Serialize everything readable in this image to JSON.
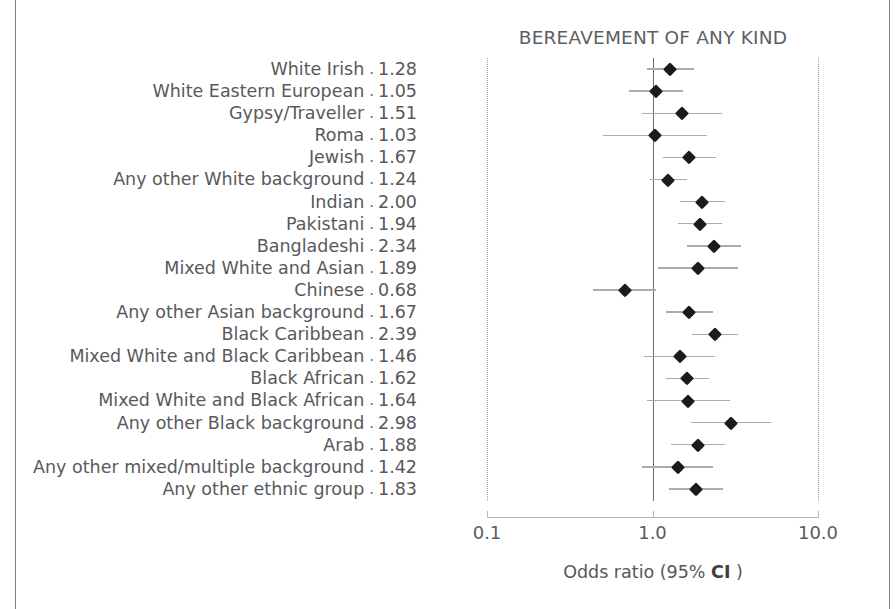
{
  "chart_data": {
    "type": "scatter",
    "subtype": "forest-plot",
    "title": "BEREAVEMENT OF ANY KIND",
    "xlabel_prefix": "Odds ratio (95% ",
    "xlabel_emph": "CI",
    "xlabel_suffix": " )",
    "xlabel_full": "Odds ratio (95% CI )",
    "ylabel": "",
    "xscale": "log",
    "xlim": [
      0.1,
      10.0
    ],
    "xticks": [
      0.1,
      1.0,
      10.0
    ],
    "xticklabels": [
      "0.1",
      "1.0",
      "10.0"
    ],
    "reference_line": 1.0,
    "grid": "dotted vertical at 0.1 and 10.0",
    "legend": "none",
    "marker": "black diamond",
    "value_separator": ".",
    "categories": [
      "White Irish",
      "White Eastern European",
      "Gypsy/Traveller",
      "Roma",
      "Jewish",
      "Any other White background",
      "Indian",
      "Pakistani",
      "Bangladeshi",
      "Mixed White and Asian",
      "Chinese",
      "Any other Asian background",
      "Black Caribbean",
      "Mixed White and Black Caribbean",
      "Black African",
      "Mixed White and Black African",
      "Any other Black background",
      "Arab",
      "Any other mixed/multiple background",
      "Any other ethnic group"
    ],
    "values": [
      1.28,
      1.05,
      1.51,
      1.03,
      1.67,
      1.24,
      2.0,
      1.94,
      2.34,
      1.89,
      0.68,
      1.67,
      2.39,
      1.46,
      1.62,
      1.64,
      2.98,
      1.88,
      1.42,
      1.83
    ],
    "value_labels": [
      "1.28",
      "1.05",
      "1.51",
      "1.03",
      "1.67",
      "1.24",
      "2.00",
      "1.94",
      "2.34",
      "1.89",
      "0.68",
      "1.67",
      "2.39",
      "1.46",
      "1.62",
      "1.64",
      "2.98",
      "1.88",
      "1.42",
      "1.83"
    ],
    "ci_low": [
      0.93,
      0.72,
      0.86,
      0.5,
      1.15,
      0.96,
      1.47,
      1.42,
      1.61,
      1.08,
      0.44,
      1.2,
      1.74,
      0.89,
      1.2,
      0.92,
      1.7,
      1.29,
      0.87,
      1.26
    ],
    "ci_high": [
      1.77,
      1.52,
      2.64,
      2.13,
      2.43,
      1.61,
      2.73,
      2.64,
      3.41,
      3.29,
      1.05,
      2.33,
      3.29,
      2.4,
      2.2,
      2.93,
      5.21,
      2.73,
      2.32,
      2.65
    ]
  },
  "figure": {
    "rule_color": "#7e8083",
    "marker_color": "#1b1b1d",
    "ci_color": "#a9abae",
    "reference_color": "#6a6c70",
    "grid_color": "#9b9da0",
    "text_color": "#56575a"
  }
}
